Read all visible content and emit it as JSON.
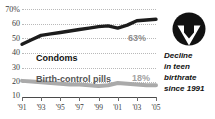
{
  "chart_data": {
    "type": "line",
    "title": "",
    "xlabel": "",
    "ylabel": "",
    "ylim": [
      10,
      70
    ],
    "yticks": [
      10,
      20,
      30,
      40,
      50,
      60,
      70
    ],
    "ytick_labels": [
      "10",
      "20",
      "30",
      "40",
      "50",
      "60",
      "70%"
    ],
    "grid": true,
    "legend_position": "inline-labels",
    "x": [
      1991,
      1992,
      1993,
      1994,
      1995,
      1996,
      1997,
      1998,
      1999,
      2000,
      2001,
      2002,
      2003,
      2004,
      2005
    ],
    "xtick_labels": [
      "'91",
      "'93",
      "'95",
      "'97",
      "'99",
      "'01",
      "'03",
      "'05"
    ],
    "xtick_years": [
      1991,
      1993,
      1995,
      1997,
      1999,
      2001,
      2003,
      2005
    ],
    "series": [
      {
        "name": "Condoms",
        "color": "#1c1c1c",
        "end_label": "63%",
        "values": [
          46,
          49,
          52,
          53,
          54,
          55,
          56,
          57,
          58,
          58.5,
          57,
          59,
          62,
          62.5,
          63
        ]
      },
      {
        "name": "Birth-control pills",
        "color": "#aaaaaa",
        "end_label": "18%",
        "values": [
          21,
          20.5,
          20,
          19.5,
          19,
          18.5,
          18.5,
          18,
          17.5,
          18,
          19.5,
          19,
          18.5,
          18,
          18
        ]
      }
    ]
  },
  "callout": {
    "percent": "33%",
    "lines": [
      "Decline",
      "in teen",
      "birthrate",
      "since 1991"
    ],
    "icon": "down-arrow-circle-icon",
    "badge_color": "#111111",
    "arrow_color": "#ffffff"
  }
}
